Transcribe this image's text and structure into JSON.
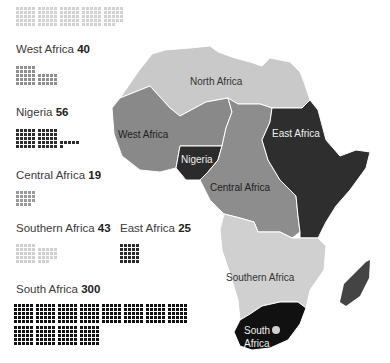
{
  "chart_data": {
    "type": "pictogram-map",
    "title": "",
    "unit_note": "each square = 1",
    "categories": [
      "North Africa",
      "West Africa",
      "Nigeria",
      "Central Africa",
      "Southern Africa",
      "East Africa",
      "South Africa"
    ],
    "values": [
      null,
      40,
      56,
      19,
      43,
      25,
      300
    ],
    "colors": {
      "North Africa": "#c8c8c8",
      "West Africa": "#8a8a8a",
      "Nigeria": "#2a2a2a",
      "Central Africa": "#8f8f8f",
      "Southern Africa": "#cfcfcf",
      "East Africa": "#2e2e2e",
      "South Africa": "#111111"
    }
  },
  "groups": [
    {
      "name": "North Africa",
      "value": "",
      "count": 123,
      "color": "#d2d2d2",
      "x": 16,
      "y": 7
    },
    {
      "name": "West Africa",
      "value": "40",
      "count": 40,
      "color": "#8f8f8f",
      "x": 16,
      "y": 66
    },
    {
      "name": "Nigeria",
      "value": "56",
      "count": 56,
      "color": "#2c2c2c",
      "x": 16,
      "y": 129
    },
    {
      "name": "Central Africa",
      "value": "19",
      "count": 19,
      "color": "#9a9a9a",
      "x": 16,
      "y": 191
    },
    {
      "name": "Southern Africa",
      "value": "43",
      "count": 43,
      "color": "#d0d0d0",
      "x": 16,
      "y": 244
    },
    {
      "name": "East Africa",
      "value": "25",
      "count": 25,
      "color": "#2a2a2a",
      "x": 120,
      "y": 244
    },
    {
      "name": "South Africa",
      "value": "300",
      "count": 300,
      "color": "#111111",
      "x": 14,
      "y": 304
    }
  ],
  "labels": [
    {
      "name": "West Africa",
      "value": "40",
      "x": 16,
      "y": 43
    },
    {
      "name": "Nigeria",
      "value": "56",
      "x": 16,
      "y": 106
    },
    {
      "name": "Central Africa",
      "value": "19",
      "x": 16,
      "y": 169
    },
    {
      "name": "Southern Africa",
      "value": "43",
      "x": 16,
      "y": 222
    },
    {
      "name": "East Africa",
      "value": "25",
      "x": 120,
      "y": 222
    },
    {
      "name": "South Africa",
      "value": "300",
      "x": 16,
      "y": 283
    }
  ],
  "map_labels": {
    "north": "North Africa",
    "west": "West Africa",
    "nigeria": "Nigeria",
    "east": "East Africa",
    "central": "Central Africa",
    "southern": "Southern Africa",
    "south1": "South",
    "south2": "Africa"
  }
}
